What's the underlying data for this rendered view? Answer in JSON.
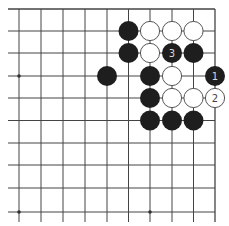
{
  "board": {
    "columns_x": [
      19,
      41,
      63,
      85,
      107,
      128.5,
      150,
      172,
      193.5,
      215
    ],
    "rows_y": [
      9,
      31,
      53,
      76,
      98,
      120.5,
      143,
      165,
      188,
      212
    ],
    "right_edge": true,
    "top_edge": true,
    "left_edge": false,
    "bottom_edge": false,
    "line_color": "#444444",
    "star_points": [
      [
        0,
        3
      ],
      [
        0,
        9
      ],
      [
        6,
        9
      ]
    ]
  },
  "colors": {
    "black_stone": "#1e1e1e",
    "white_stone": "#ffffff",
    "white_stone_border": "#555555",
    "label_on_black": "#d8d8d8",
    "label_on_white": "#444444"
  },
  "stones": [
    {
      "col": 5,
      "row": 1,
      "color": "black",
      "label": ""
    },
    {
      "col": 6,
      "row": 1,
      "color": "white",
      "label": ""
    },
    {
      "col": 7,
      "row": 1,
      "color": "white",
      "label": ""
    },
    {
      "col": 8,
      "row": 1,
      "color": "white",
      "label": ""
    },
    {
      "col": 5,
      "row": 2,
      "color": "black",
      "label": ""
    },
    {
      "col": 6,
      "row": 2,
      "color": "white",
      "label": ""
    },
    {
      "col": 7,
      "row": 2,
      "color": "black",
      "label": "3"
    },
    {
      "col": 8,
      "row": 2,
      "color": "black",
      "label": ""
    },
    {
      "col": 4,
      "row": 3,
      "color": "black",
      "label": ""
    },
    {
      "col": 6,
      "row": 3,
      "color": "black",
      "label": ""
    },
    {
      "col": 7,
      "row": 3,
      "color": "white",
      "label": ""
    },
    {
      "col": 9,
      "row": 3,
      "color": "black",
      "label": "1"
    },
    {
      "col": 6,
      "row": 4,
      "color": "black",
      "label": ""
    },
    {
      "col": 7,
      "row": 4,
      "color": "white",
      "label": ""
    },
    {
      "col": 8,
      "row": 4,
      "color": "white",
      "label": ""
    },
    {
      "col": 9,
      "row": 4,
      "color": "white",
      "label": "2"
    },
    {
      "col": 6,
      "row": 5,
      "color": "black",
      "label": ""
    },
    {
      "col": 7,
      "row": 5,
      "color": "black",
      "label": ""
    },
    {
      "col": 8,
      "row": 5,
      "color": "black",
      "label": ""
    }
  ]
}
